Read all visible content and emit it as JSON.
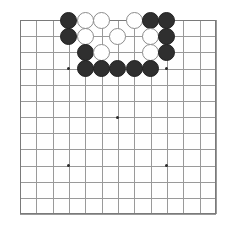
{
  "app": {
    "title": "Go Board",
    "board_type": "goban"
  },
  "board": {
    "size": 13,
    "columns": 13,
    "rows": 13,
    "origin_x": 20,
    "origin_y": 20,
    "cell_size_x": 16.33,
    "cell_size_y": 16.17,
    "line_color": "#9a9a9a",
    "border_color": "#7a7a7a",
    "background_color": "#ffffff",
    "black_stone_color": "#2f2f2f",
    "white_stone_color": "#ffffff",
    "white_stone_outline": "#8c8c8c",
    "star_point_color": "#2c2c2c",
    "star_points": [
      {
        "col": 3,
        "row": 3
      },
      {
        "col": 9,
        "row": 3
      },
      {
        "col": 6,
        "row": 6
      },
      {
        "col": 3,
        "row": 9
      },
      {
        "col": 9,
        "row": 9
      }
    ],
    "stones": [
      {
        "col": 3,
        "row": 0,
        "color": "black"
      },
      {
        "col": 4,
        "row": 0,
        "color": "white"
      },
      {
        "col": 5,
        "row": 0,
        "color": "white"
      },
      {
        "col": 7,
        "row": 0,
        "color": "white"
      },
      {
        "col": 8,
        "row": 0,
        "color": "black"
      },
      {
        "col": 9,
        "row": 0,
        "color": "black"
      },
      {
        "col": 3,
        "row": 1,
        "color": "black"
      },
      {
        "col": 4,
        "row": 1,
        "color": "white"
      },
      {
        "col": 6,
        "row": 1,
        "color": "white"
      },
      {
        "col": 8,
        "row": 1,
        "color": "white"
      },
      {
        "col": 9,
        "row": 1,
        "color": "black"
      },
      {
        "col": 4,
        "row": 2,
        "color": "black"
      },
      {
        "col": 5,
        "row": 2,
        "color": "white"
      },
      {
        "col": 8,
        "row": 2,
        "color": "white"
      },
      {
        "col": 9,
        "row": 2,
        "color": "black"
      },
      {
        "col": 4,
        "row": 3,
        "color": "black"
      },
      {
        "col": 5,
        "row": 3,
        "color": "black"
      },
      {
        "col": 6,
        "row": 3,
        "color": "black"
      },
      {
        "col": 7,
        "row": 3,
        "color": "black"
      },
      {
        "col": 8,
        "row": 3,
        "color": "black"
      }
    ]
  }
}
